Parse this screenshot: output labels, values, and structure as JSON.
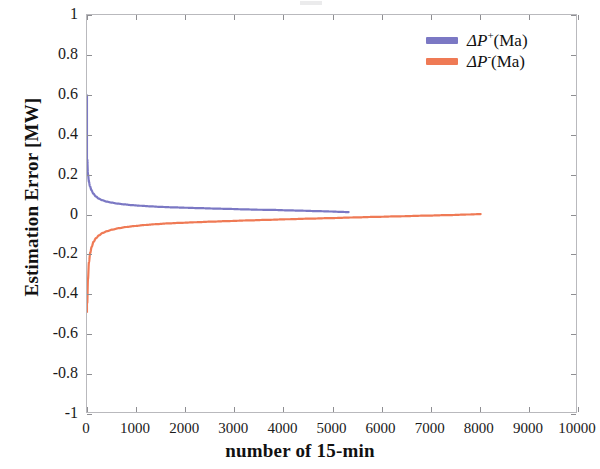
{
  "figure": {
    "background_color": "#ffffff",
    "axis_color": "#b9b9bd"
  },
  "chart_data": {
    "type": "line",
    "title": "",
    "xlabel": "number of 15-min",
    "ylabel": "Estimation Error [MW]",
    "xlim": [
      0,
      10000
    ],
    "ylim": [
      -1,
      1
    ],
    "xticks": [
      0,
      1000,
      2000,
      3000,
      4000,
      5000,
      6000,
      7000,
      8000,
      9000,
      10000
    ],
    "xtick_labels": [
      "0",
      "1000",
      "2000",
      "3000",
      "4000",
      "5000",
      "6000",
      "7000",
      "8000",
      "9000",
      "10000"
    ],
    "yticks": [
      -1,
      -0.8,
      -0.6,
      -0.4,
      -0.2,
      0,
      0.2,
      0.4,
      0.6,
      0.8,
      1
    ],
    "ytick_labels": [
      "-1",
      "-0.8",
      "-0.6",
      "-0.4",
      "-0.2",
      "0",
      "0.2",
      "0.4",
      "0.6",
      "0.8",
      "1"
    ],
    "grid": false,
    "legend_position": "upper right",
    "series": [
      {
        "name": "ΔP⁺(Ma)",
        "name_base": "ΔP",
        "name_sup": "+",
        "name_suffix": "(Ma)",
        "color": "#7b78c4",
        "x": [
          5,
          20,
          40,
          60,
          90,
          130,
          180,
          240,
          310,
          400,
          500,
          620,
          760,
          920,
          1100,
          1300,
          1520,
          1760,
          2020,
          2300,
          2600,
          2900,
          3200,
          3500,
          3800,
          4100,
          4400,
          4700,
          5000,
          5200,
          5350
        ],
        "y": [
          0.27,
          0.198,
          0.16,
          0.138,
          0.118,
          0.1,
          0.086,
          0.075,
          0.067,
          0.06,
          0.055,
          0.05,
          0.046,
          0.042,
          0.039,
          0.036,
          0.033,
          0.031,
          0.029,
          0.027,
          0.025,
          0.023,
          0.021,
          0.019,
          0.018,
          0.016,
          0.014,
          0.012,
          0.01,
          0.008,
          0.007
        ]
      },
      {
        "name": "ΔP⁻(Ma)",
        "name_base": "ΔP",
        "name_sup": "-",
        "name_suffix": "(Ma)",
        "color": "#ef7a55",
        "x": [
          5,
          20,
          40,
          65,
          95,
          135,
          185,
          245,
          320,
          410,
          520,
          650,
          800,
          980,
          1180,
          1400,
          1650,
          1920,
          2220,
          2550,
          2900,
          3280,
          3680,
          4100,
          4550,
          5000,
          5450,
          5900,
          6400,
          6900,
          7400,
          7800,
          8050
        ],
        "y": [
          -0.45,
          -0.33,
          -0.245,
          -0.2,
          -0.168,
          -0.142,
          -0.124,
          -0.11,
          -0.098,
          -0.089,
          -0.081,
          -0.074,
          -0.068,
          -0.063,
          -0.058,
          -0.054,
          -0.05,
          -0.047,
          -0.044,
          -0.041,
          -0.038,
          -0.035,
          -0.032,
          -0.029,
          -0.026,
          -0.023,
          -0.02,
          -0.017,
          -0.014,
          -0.011,
          -0.008,
          -0.005,
          -0.003
        ]
      }
    ]
  }
}
